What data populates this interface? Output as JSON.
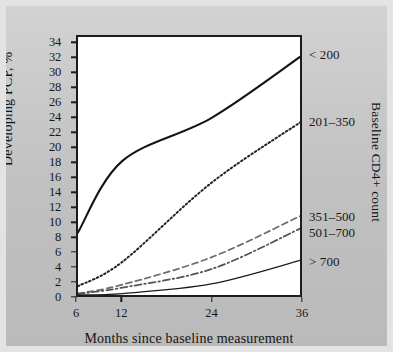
{
  "chart_data": {
    "type": "line",
    "title": "",
    "xlabel": "Months since baseline measurement",
    "ylabel": "Developing PCP, %",
    "right_axis_title": "Baseline CD4+ count",
    "x": [
      6,
      12,
      24,
      36
    ],
    "xticks": [
      "6",
      "12",
      "24",
      "36"
    ],
    "xlim": [
      6,
      36
    ],
    "ylim": [
      0,
      35
    ],
    "yticks": [
      "0",
      "2",
      "4",
      "6",
      "8",
      "10",
      "12",
      "14",
      "16",
      "18",
      "20",
      "22",
      "24",
      "26",
      "28",
      "30",
      "32",
      "34"
    ],
    "grid": false,
    "legend_position": "right-outside",
    "series": [
      {
        "name": "< 200",
        "style": "solid-thick",
        "color": "#141414",
        "values": [
          8.5,
          18.2,
          24.0,
          32.3
        ],
        "label_y": 32.3
      },
      {
        "name": "201–350",
        "style": "dotted",
        "color": "#222222",
        "values": [
          1.2,
          4.5,
          15.2,
          23.4
        ],
        "label_y": 23.4
      },
      {
        "name": "351–500",
        "style": "dashed",
        "color": "#6e6e6e",
        "values": [
          0.2,
          1.4,
          5.1,
          10.7
        ],
        "label_y": 10.7
      },
      {
        "name": "501–700",
        "style": "dash-dot",
        "color": "#555555",
        "values": [
          0.15,
          1.0,
          3.5,
          9.0
        ],
        "label_y": 8.6
      },
      {
        "name": "> 700",
        "style": "solid-thin",
        "color": "#1c1c1c",
        "values": [
          0.0,
          0.2,
          1.5,
          4.7
        ],
        "label_y": 4.7
      }
    ]
  }
}
